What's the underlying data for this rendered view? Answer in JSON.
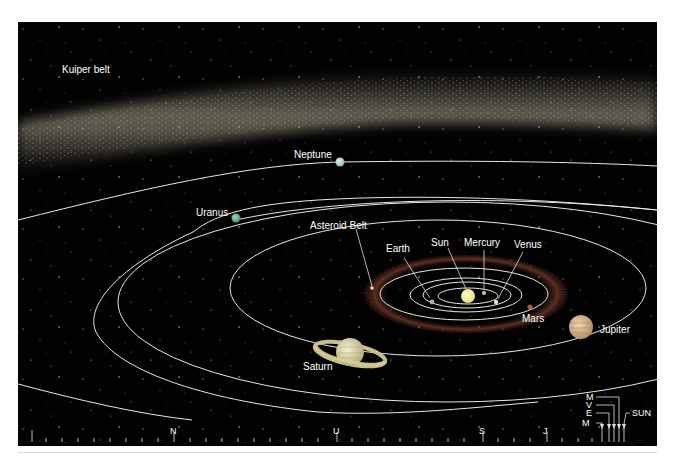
{
  "diagram": {
    "background_color": "#020202",
    "orbit_color": "#e6e6e6",
    "kuiper_belt": {
      "label": "Kuiper belt"
    },
    "asteroid_belt": {
      "label": "Asteroid Belt"
    },
    "sun": {
      "label": "Sun",
      "color": "#f4f08a"
    },
    "planets": [
      {
        "id": "mercury",
        "label": "Mercury",
        "color": "#d9c8a0"
      },
      {
        "id": "venus",
        "label": "Venus",
        "color": "#e6e0c8"
      },
      {
        "id": "earth",
        "label": "Earth",
        "color": "#9ab8b0"
      },
      {
        "id": "mars",
        "label": "Mars",
        "color": "#c0503a"
      },
      {
        "id": "jupiter",
        "label": "Jupiter",
        "color": "#d8b990"
      },
      {
        "id": "saturn",
        "label": "Saturn",
        "color": "#e0dcb0"
      },
      {
        "id": "uranus",
        "label": "Uranus",
        "color": "#5fb88a"
      },
      {
        "id": "neptune",
        "label": "Neptune",
        "color": "#b8d4d4"
      }
    ],
    "scale_bar": {
      "markers": [
        {
          "label": "N"
        },
        {
          "label": "U"
        },
        {
          "label": "S"
        },
        {
          "label": "J"
        }
      ],
      "inner_markers": [
        {
          "label": "M"
        },
        {
          "label": "V"
        },
        {
          "label": "E"
        },
        {
          "label": "M"
        }
      ],
      "sun_label": "SUN"
    }
  }
}
